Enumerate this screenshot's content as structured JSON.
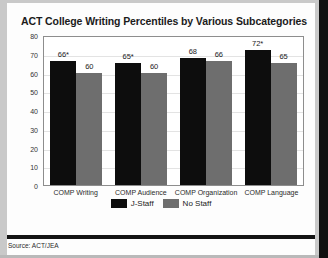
{
  "title": "ACT College Writing Percentiles by Various Subcategories",
  "source": "Source: ACT/JEA",
  "legend": [
    {
      "label": "J-Staff",
      "color": "#0d0d0d"
    },
    {
      "label": "No Staff",
      "color": "#6e6e6e"
    }
  ],
  "chart_data": {
    "type": "bar",
    "title": "ACT College Writing Percentiles by Various Subcategories",
    "xlabel": "",
    "ylabel": "",
    "ylim": [
      0,
      80
    ],
    "ytick_step": 10,
    "yticks": [
      0,
      10,
      20,
      30,
      40,
      50,
      60,
      70,
      80
    ],
    "ytick_labels": [
      "0",
      "10",
      "20",
      "30",
      "40",
      "50",
      "60",
      "70",
      "80"
    ],
    "grid": true,
    "legend_position": "bottom",
    "categories": [
      "COMP Writing",
      "COMP Audience",
      "COMP Organization",
      "COMP Language"
    ],
    "series": [
      {
        "name": "J-Staff",
        "color": "#0d0d0d",
        "values": [
          66,
          65,
          68,
          72
        ],
        "data_labels": [
          "66*",
          "65*",
          "68",
          "72*"
        ]
      },
      {
        "name": "No Staff",
        "color": "#6e6e6e",
        "values": [
          60,
          60,
          66,
          65
        ],
        "data_labels": [
          "60",
          "60",
          "66",
          "65"
        ]
      }
    ],
    "annotations": [
      "* denotes statistically significant difference"
    ]
  }
}
